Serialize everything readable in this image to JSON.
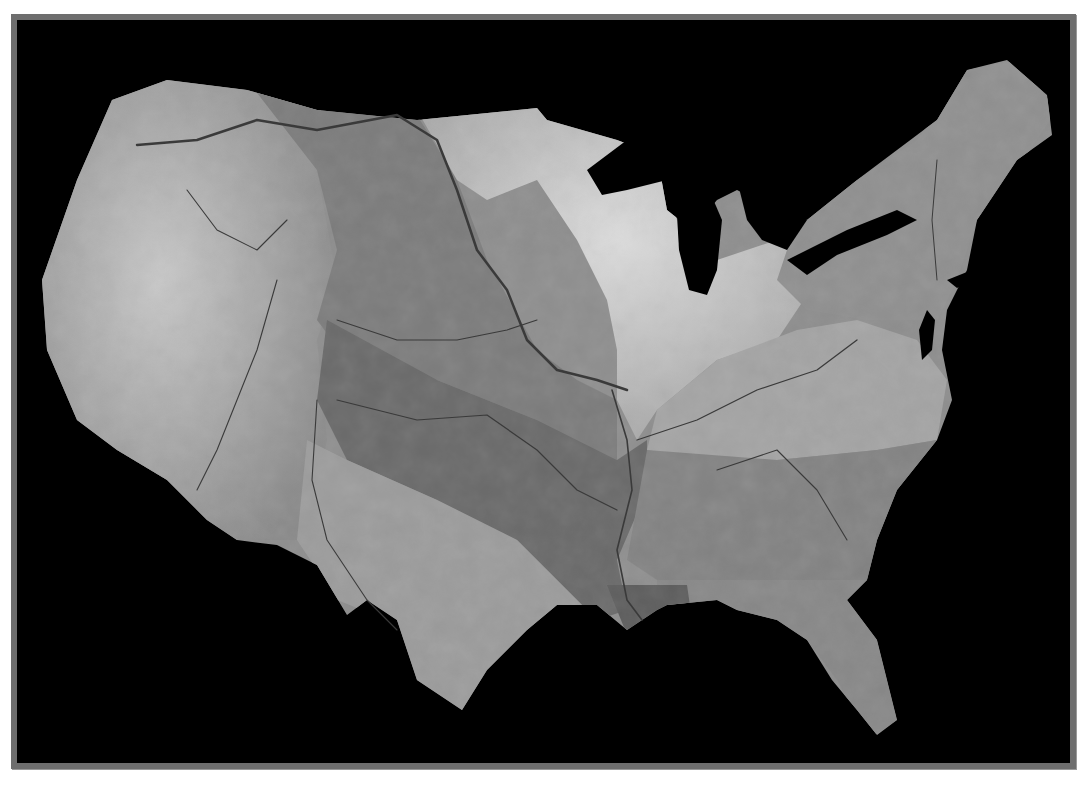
{
  "figure": {
    "type": "shaded-relief-map",
    "colors": {
      "page_background": "#ffffff",
      "frame_border": "#6e6e6e",
      "frame_background": "#000000",
      "water": "#000000",
      "river_line": "#3a3a3a"
    },
    "regions": [
      {
        "name": "west-mountain-region",
        "tone": "#9c9c9c"
      },
      {
        "name": "upper-missouri-basin",
        "tone": "#7e7e7e"
      },
      {
        "name": "mississippi-basin",
        "tone": "#6c6c6c"
      },
      {
        "name": "great-lakes-region",
        "tone": "#c4c4c4"
      },
      {
        "name": "ohio-valley",
        "tone": "#a8a8a8"
      },
      {
        "name": "northeast-region",
        "tone": "#8e8e8e"
      },
      {
        "name": "southeast-region",
        "tone": "#858585"
      },
      {
        "name": "texas-gulf-region",
        "tone": "#9a9a9a"
      },
      {
        "name": "florida",
        "tone": "#8a8a8a"
      }
    ],
    "labels": []
  }
}
